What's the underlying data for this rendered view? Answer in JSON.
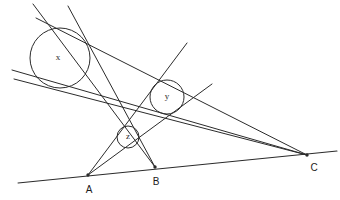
{
  "figure": {
    "background_color": "#ffffff",
    "stroke_color": "#2b2b2b",
    "width": 340,
    "height": 200
  },
  "circles": [
    {
      "id": "circle-x",
      "label": "x",
      "cx": 60,
      "cy": 58,
      "r": 30,
      "label_x": 58,
      "label_y": 58
    },
    {
      "id": "circle-y",
      "label": "y",
      "cx": 167,
      "cy": 97,
      "r": 17,
      "label_x": 167,
      "label_y": 97
    },
    {
      "id": "circle-z",
      "label": "z",
      "cx": 128,
      "cy": 137,
      "r": 11,
      "label_x": 128,
      "label_y": 137
    }
  ],
  "vertices": [
    {
      "id": "vertex-a",
      "label": "A",
      "x": 88,
      "y": 175,
      "label_x": 89,
      "label_y": 190
    },
    {
      "id": "vertex-b",
      "label": "B",
      "x": 155,
      "y": 167,
      "label_x": 156,
      "label_y": 182
    },
    {
      "id": "vertex-c",
      "label": "C",
      "x": 307,
      "y": 155,
      "label_x": 314,
      "label_y": 168
    }
  ],
  "lines": [
    {
      "id": "baseline-through-abc",
      "x1": 18,
      "y1": 183,
      "x2": 337,
      "y2": 151
    },
    {
      "id": "line-a-to-upper-right",
      "x1": 88,
      "y1": 175,
      "x2": 212,
      "y2": 84
    },
    {
      "id": "line-a-to-top-tangent",
      "x1": 88,
      "y1": 175,
      "x2": 187,
      "y2": 43
    },
    {
      "id": "line-b-to-circle-x-tangent",
      "x1": 155,
      "y1": 167,
      "x2": 68,
      "y2": 6
    },
    {
      "id": "line-b-to-upper-left-tangent",
      "x1": 155,
      "y1": 167,
      "x2": 33,
      "y2": 4
    },
    {
      "id": "line-c-to-circle-x-upper-tangent",
      "x1": 307,
      "y1": 155,
      "x2": 36,
      "y2": 18
    },
    {
      "id": "line-c-to-circle-x-lower-tangent",
      "x1": 307,
      "y1": 155,
      "x2": 12,
      "y2": 70
    },
    {
      "id": "line-c-to-left-edge-tangent",
      "x1": 307,
      "y1": 155,
      "x2": 14,
      "y2": 79
    }
  ]
}
